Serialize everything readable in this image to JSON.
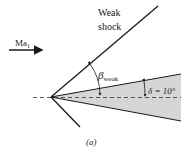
{
  "diagram": {
    "shock_label_line1": "Weak",
    "shock_label_line2": "shock",
    "mach_label": "Ma",
    "mach_subscript": "1",
    "beta_symbol": "β",
    "beta_subscript": "weak",
    "delta_label": "δ = 10°",
    "caption": "(a)",
    "colors": {
      "line": "#1a1a1a",
      "wedge_fill": "#d6d6d6",
      "dashed": "#333333"
    }
  }
}
